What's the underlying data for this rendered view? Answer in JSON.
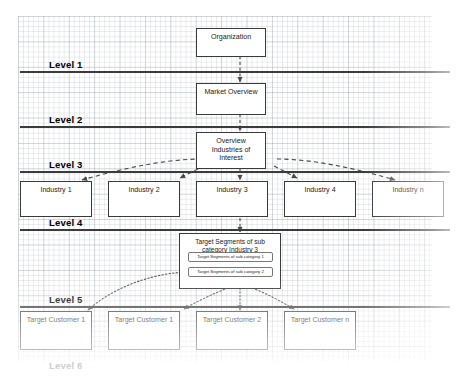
{
  "diagram": {
    "page_background": "#ffffff",
    "grid_color": "#96a0af",
    "rule_color": "#3b3b3b",
    "box_border_color": "#3a3a3a",
    "box_fill": "#ffffff",
    "connector_color": "#4a4a4a"
  },
  "levels": [
    {
      "id": "level-1",
      "label": "Level 1",
      "has_rule": true
    },
    {
      "id": "level-2",
      "label": "Level 2",
      "has_rule": true
    },
    {
      "id": "level-3",
      "label": "Level 3",
      "has_rule": true
    },
    {
      "id": "level-4",
      "label": "Level 4",
      "has_rule": true
    },
    {
      "id": "level-5",
      "label": "Level 5",
      "has_rule": true
    },
    {
      "id": "level-6",
      "label": "Level 6",
      "has_rule": false
    }
  ],
  "nodes": {
    "organization": "Organization",
    "market_overview": "Market Overview",
    "overview_industries": {
      "line1": "Overview",
      "line2": "Industries of",
      "line3": "Interest"
    },
    "target_segments_group": {
      "line1": "Target Segments of sub",
      "line2": "category Industry 3"
    }
  },
  "industries": [
    {
      "label": "Industry 1"
    },
    {
      "label": "Industry 2"
    },
    {
      "label": "Industry 3"
    },
    {
      "label": "Industry 4"
    },
    {
      "label": "Industry n"
    }
  ],
  "sub_categories": [
    {
      "label": "Target Segments of sub category 1"
    },
    {
      "label": "Target Segments of sub category 2"
    }
  ],
  "target_customers": [
    {
      "label": "Target Customer 1"
    },
    {
      "label": "Target Customer 1"
    },
    {
      "label": "Target Customer 2"
    },
    {
      "label": "Target Customer n"
    }
  ],
  "connectors": {
    "organization_to_market": "dashed-arrow-down",
    "market_to_overview": "dashed-arrow-down",
    "overview_to_industries": "dashed-arrow-fanout",
    "industry3_to_segments": "dashed-arrow-down",
    "segments_to_customers": "dotted-arrow-fanout"
  }
}
